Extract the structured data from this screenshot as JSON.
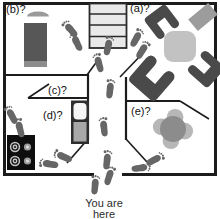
{
  "figure": {
    "kind": "floor-plan-map",
    "caption_line1": "You are",
    "caption_line2": "here"
  },
  "rooms": {
    "a": {
      "label": "(a)?"
    },
    "b": {
      "label": "(b)?"
    },
    "c": {
      "label": "(c)?"
    },
    "d": {
      "label": "(d)?"
    },
    "e": {
      "label": "(e)?"
    }
  },
  "icons": {
    "footprint": "footprint-icon",
    "staircase": "staircase-icon",
    "bed": "bed-icon",
    "rug": "rug-icon",
    "armchair": "armchair-icon",
    "table": "table-icon",
    "round_table_with_chairs": "round-table-icon",
    "refrigerator": "refrigerator-icon",
    "stove_burners": "stove-icon"
  },
  "colors": {
    "wall": "#1c1c1c",
    "stairs_fill": "#e9e9e9",
    "bed": "#575757",
    "bed_trim": "#8d8d8d",
    "rug": "#9a9a9a",
    "chair_dark": "#4a4a4a",
    "table_light": "#c2c2c2",
    "sideboard": "#9c9c9c",
    "round_table": "#8c8c8c",
    "petal": "#b7b7b7",
    "fridge_top": "#f5f5f5",
    "fridge_bottom": "#a8a8a8",
    "stove": "#0e0e0e",
    "footprint": "#666666",
    "label_text": "#111111"
  },
  "footprints": [
    {
      "x": 95,
      "y": 186,
      "r": 5,
      "flip": false
    },
    {
      "x": 109,
      "y": 177,
      "r": 18,
      "flip": true
    },
    {
      "x": 107,
      "y": 161,
      "r": 6,
      "flip": false
    },
    {
      "x": 104,
      "y": 128,
      "r": -6,
      "flip": true
    },
    {
      "x": 110,
      "y": 90,
      "r": 6,
      "flip": false
    },
    {
      "x": 99,
      "y": 64,
      "r": -15,
      "flip": true
    },
    {
      "x": 108,
      "y": 47,
      "r": 12,
      "flip": false
    },
    {
      "x": 71,
      "y": 30,
      "r": -40,
      "flip": false
    },
    {
      "x": 77,
      "y": 43,
      "r": -25,
      "flip": true
    },
    {
      "x": 136,
      "y": 39,
      "r": 28,
      "flip": false
    },
    {
      "x": 142,
      "y": 51,
      "r": 32,
      "flip": true
    },
    {
      "x": 140,
      "y": 168,
      "r": 82,
      "flip": false
    },
    {
      "x": 154,
      "y": 160,
      "r": 62,
      "flip": true
    },
    {
      "x": 50,
      "y": 164,
      "r": -82,
      "flip": false
    },
    {
      "x": 64,
      "y": 157,
      "r": -66,
      "flip": true
    },
    {
      "x": 12,
      "y": 116,
      "r": -28,
      "flip": false
    },
    {
      "x": 20,
      "y": 129,
      "r": -14,
      "flip": true
    }
  ]
}
